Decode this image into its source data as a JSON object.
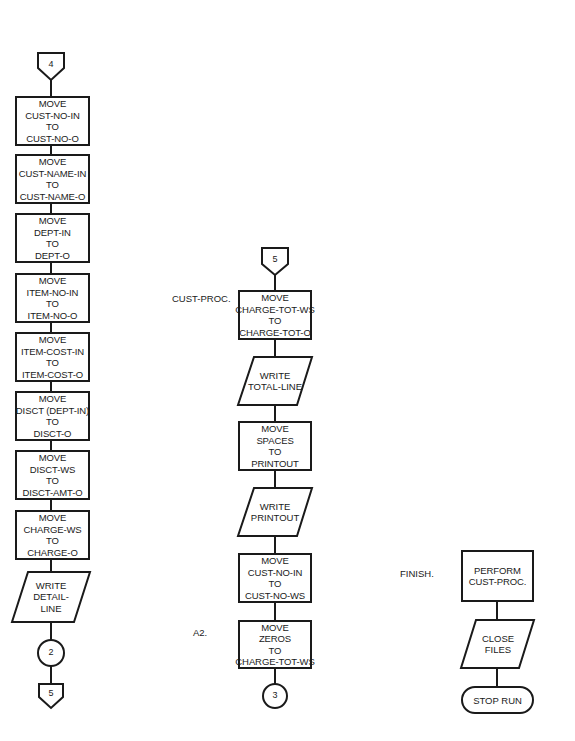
{
  "diagram": {
    "type": "flowchart",
    "columns": [
      {
        "id": "left",
        "entry_connector": "4",
        "steps": [
          {
            "shape": "process",
            "lines": [
              "MOVE",
              "CUST-NO-IN",
              "TO",
              "CUST-NO-O"
            ]
          },
          {
            "shape": "process",
            "lines": [
              "MOVE",
              "CUST-NAME-IN",
              "TO",
              "CUST-NAME-O"
            ]
          },
          {
            "shape": "process",
            "lines": [
              "MOVE",
              "DEPT-IN",
              "TO",
              "DEPT-O"
            ]
          },
          {
            "shape": "process",
            "lines": [
              "MOVE",
              "ITEM-NO-IN",
              "TO",
              "ITEM-NO-O"
            ]
          },
          {
            "shape": "process",
            "lines": [
              "MOVE",
              "ITEM-COST-IN",
              "TO",
              "ITEM-COST-O"
            ]
          },
          {
            "shape": "process",
            "lines": [
              "MOVE",
              "DISCT (DEPT-IN)",
              "TO",
              "DISCT-O"
            ]
          },
          {
            "shape": "process",
            "lines": [
              "MOVE",
              "DISCT-WS",
              "TO",
              "DISCT-AMT-O"
            ]
          },
          {
            "shape": "process",
            "lines": [
              "MOVE",
              "CHARGE-WS",
              "TO",
              "CHARGE-O"
            ]
          },
          {
            "shape": "io",
            "lines": [
              "WRITE",
              "DETAIL-",
              "LINE"
            ]
          }
        ],
        "connector": "2",
        "exit_connector": "5"
      },
      {
        "id": "middle",
        "entry_connector": "5",
        "labels": {
          "cust_proc": "CUST-PROC.",
          "a2": "A2."
        },
        "steps": [
          {
            "shape": "process",
            "lines": [
              "MOVE",
              "CHARGE-TOT-WS",
              "TO",
              "CHARGE-TOT-O"
            ]
          },
          {
            "shape": "io",
            "lines": [
              "WRITE",
              "TOTAL-LINE"
            ]
          },
          {
            "shape": "process",
            "lines": [
              "MOVE",
              "SPACES",
              "TO",
              "PRINTOUT"
            ]
          },
          {
            "shape": "io",
            "lines": [
              "WRITE",
              "PRINTOUT"
            ]
          },
          {
            "shape": "process",
            "lines": [
              "MOVE",
              "CUST-NO-IN",
              "TO",
              "CUST-NO-WS"
            ]
          },
          {
            "shape": "process",
            "lines": [
              "MOVE",
              "ZEROS",
              "TO",
              "CHARGE-TOT-WS"
            ]
          }
        ],
        "connector": "3"
      },
      {
        "id": "right",
        "labels": {
          "finish": "FINISH."
        },
        "steps": [
          {
            "shape": "process",
            "lines": [
              "PERFORM",
              "CUST-PROC."
            ]
          },
          {
            "shape": "io",
            "lines": [
              "CLOSE",
              "FILES"
            ]
          },
          {
            "shape": "terminator",
            "lines": [
              "STOP RUN"
            ]
          }
        ]
      }
    ]
  }
}
